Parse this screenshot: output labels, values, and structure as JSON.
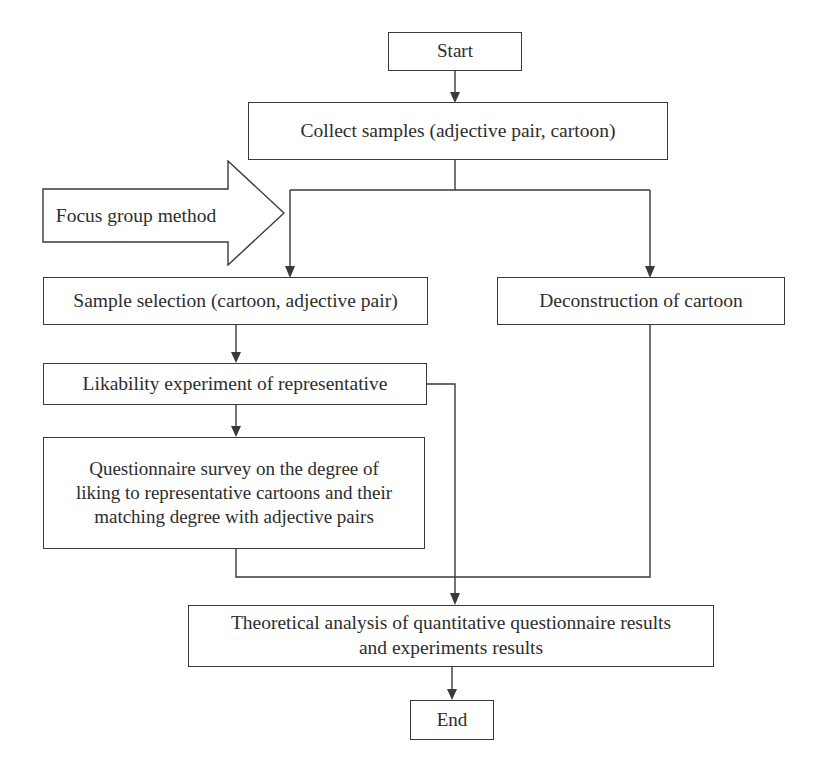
{
  "diagram": {
    "background_color": "#ffffff",
    "line_color": "#3a3a3a",
    "text_color": "#2d2d2d"
  },
  "nodes": {
    "start": {
      "label": "Start",
      "shape": "rectangle"
    },
    "collect": {
      "label": "Collect samples (adjective pair, cartoon)",
      "shape": "rectangle"
    },
    "focus_group": {
      "label": "Focus group method",
      "shape": "block-arrow-right"
    },
    "sample_selection": {
      "label": "Sample selection (cartoon, adjective pair)",
      "shape": "rectangle"
    },
    "deconstruction": {
      "label": "Deconstruction of cartoon",
      "shape": "rectangle"
    },
    "likability": {
      "label": "Likability experiment of representative",
      "shape": "rectangle"
    },
    "questionnaire": {
      "label": "Questionnaire survey on the degree of\nliking to representative cartoons and their\nmatching degree with adjective pairs",
      "shape": "rectangle"
    },
    "theoretical": {
      "label": "Theoretical analysis of quantitative questionnaire results\nand experiments results",
      "shape": "rectangle"
    },
    "end": {
      "label": "End",
      "shape": "rectangle"
    }
  },
  "edges": [
    {
      "from": "start",
      "to": "collect",
      "arrow": true
    },
    {
      "from": "collect",
      "to": "sample_selection",
      "arrow": true
    },
    {
      "from": "collect",
      "to": "deconstruction",
      "arrow": true
    },
    {
      "from": "focus_group",
      "to": "sample_selection",
      "arrow": false
    },
    {
      "from": "sample_selection",
      "to": "likability",
      "arrow": true
    },
    {
      "from": "likability",
      "to": "questionnaire",
      "arrow": true
    },
    {
      "from": "likability",
      "to": "theoretical",
      "arrow": true
    },
    {
      "from": "questionnaire",
      "to": "theoretical",
      "arrow": true
    },
    {
      "from": "deconstruction",
      "to": "theoretical",
      "arrow": true
    },
    {
      "from": "theoretical",
      "to": "end",
      "arrow": true
    }
  ]
}
